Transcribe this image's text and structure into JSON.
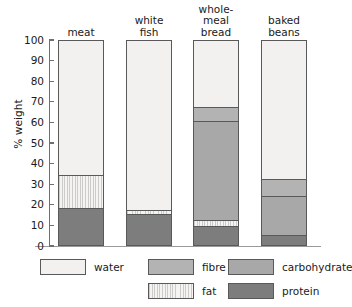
{
  "chart_data": {
    "type": "bar",
    "subtype": "stacked-bar-100",
    "title": "",
    "xlabel": "",
    "ylabel": "% weight",
    "ylim": [
      0,
      100
    ],
    "yticks": [
      0,
      10,
      20,
      30,
      40,
      50,
      60,
      70,
      80,
      90,
      100
    ],
    "grid": false,
    "legend_position": "bottom",
    "categories": [
      "meat",
      "white fish",
      "whole-meal bread",
      "baked beans"
    ],
    "category_label_lines": [
      [
        "meat"
      ],
      [
        "white",
        "fish"
      ],
      [
        "whole-",
        "meal",
        "bread"
      ],
      [
        "baked",
        "beans"
      ]
    ],
    "series": [
      {
        "name": "protein",
        "color": "#7d7d7d",
        "values": [
          18,
          15,
          9,
          5
        ]
      },
      {
        "name": "fat",
        "color": "#f5f4f2",
        "values": [
          16,
          2,
          3,
          0
        ]
      },
      {
        "name": "carbohydrate",
        "color": "#a8a8a8",
        "values": [
          0,
          0,
          48,
          19
        ]
      },
      {
        "name": "fibre",
        "color": "#b3b3b3",
        "values": [
          0,
          0,
          7,
          8
        ]
      },
      {
        "name": "water",
        "color": "#f2f1ef",
        "values": [
          66,
          83,
          33,
          68
        ]
      }
    ],
    "stack_order_bottom_to_top": [
      "protein",
      "fat",
      "carbohydrate",
      "fibre",
      "water"
    ],
    "legend": [
      {
        "key": "water",
        "label": "water",
        "color": "#f2f1ef"
      },
      {
        "key": "fibre",
        "label": "fibre",
        "color": "#b3b3b3"
      },
      {
        "key": "carbohydrate",
        "label": "carbohydrate",
        "color": "#a8a8a8"
      },
      {
        "key": "fat",
        "label": "fat",
        "color": "#f5f4f2"
      },
      {
        "key": "protein",
        "label": "protein",
        "color": "#7d7d7d"
      }
    ]
  },
  "axis": {
    "y_title": "% weight",
    "y_tick_labels": [
      "100",
      "90",
      "80",
      "70",
      "60",
      "50",
      "40",
      "30",
      "20",
      "10",
      "0"
    ]
  }
}
